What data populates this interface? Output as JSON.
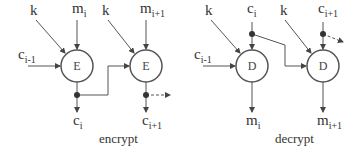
{
  "encrypt": {
    "caption": "encrypt",
    "node_label": "E",
    "key_label": "k",
    "inputs": {
      "prev_cipher": {
        "base": "c",
        "sub": "i-1"
      },
      "m_i": {
        "base": "m",
        "sub": "i"
      },
      "m_i1": {
        "base": "m",
        "sub": "i+1"
      }
    },
    "outputs": {
      "c_i": {
        "base": "c",
        "sub": "i"
      },
      "c_i1": {
        "base": "c",
        "sub": "i+1"
      }
    }
  },
  "decrypt": {
    "caption": "decrypt",
    "node_label": "D",
    "key_label": "k",
    "inputs": {
      "prev_cipher": {
        "base": "c",
        "sub": "i-1"
      },
      "c_i": {
        "base": "c",
        "sub": "i"
      },
      "c_i1": {
        "base": "c",
        "sub": "i+1"
      }
    },
    "outputs": {
      "m_i": {
        "base": "m",
        "sub": "i"
      },
      "m_i1": {
        "base": "m",
        "sub": "i+1"
      }
    }
  }
}
